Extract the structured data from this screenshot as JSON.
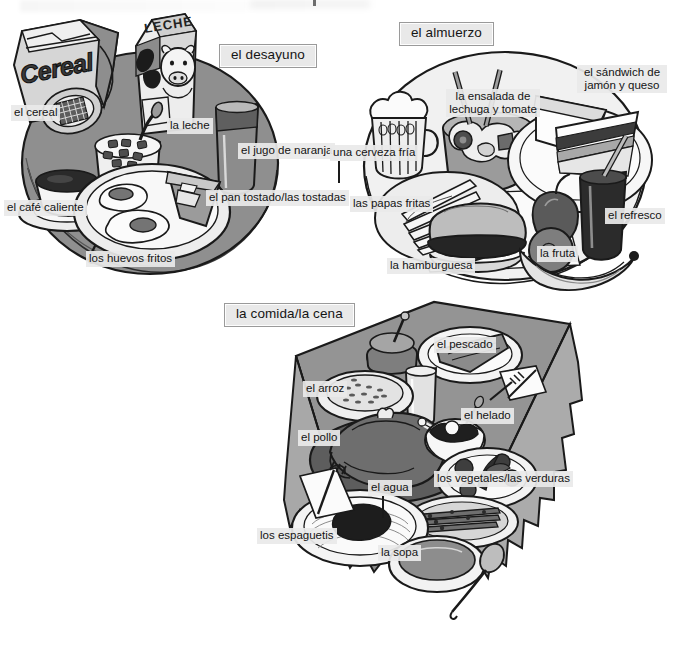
{
  "page": {
    "kind": "illustrated-vocabulary-plate",
    "language": "Spanish",
    "background_color": "#ffffff",
    "label_fill": "#e9e9e9",
    "ink_color": "#1a1a1a"
  },
  "sections": [
    {
      "id": "breakfast",
      "title": "el desayuno",
      "labels": [
        {
          "key": "cereal",
          "text": "el cereal"
        },
        {
          "key": "milk",
          "text": "la leche"
        },
        {
          "key": "oj",
          "text": "el jugo de naranja"
        },
        {
          "key": "coffee",
          "text": "el café caliente"
        },
        {
          "key": "toast",
          "text": "el pan tostado/las tostadas"
        },
        {
          "key": "eggs",
          "text": "los huevos fritos"
        }
      ],
      "props": [
        "cereal-box",
        "milk-carton",
        "orange-juice-glass",
        "coffee-cup-saucer",
        "cereal-bowl-spoon",
        "fried-eggs-plate",
        "toast-slices",
        "fork"
      ]
    },
    {
      "id": "lunch",
      "title": "el almuerzo",
      "labels": [
        {
          "key": "beer",
          "text": "una cerveza fría"
        },
        {
          "key": "salad",
          "text": "la ensalada de lechuga y tomate",
          "line1": "la ensalada de",
          "line2": "lechuga y tomate"
        },
        {
          "key": "sandwich",
          "text": "el sándwich de jamón y queso",
          "line1": "el sándwich de",
          "line2": "jamón y queso"
        },
        {
          "key": "fries",
          "text": "las papas fritas"
        },
        {
          "key": "burger",
          "text": "la hamburguesa"
        },
        {
          "key": "fruit",
          "text": "la fruta"
        },
        {
          "key": "soda",
          "text": "el refresco"
        }
      ],
      "props": [
        "beer-mug",
        "salad-bowl-tongs",
        "ham-cheese-sandwich-plate",
        "french-fries",
        "hamburger",
        "apple",
        "orange",
        "banana",
        "soda-glass-straw",
        "napkin"
      ]
    },
    {
      "id": "dinner",
      "title": "la comida/la cena",
      "labels": [
        {
          "key": "fish",
          "text": "el pescado"
        },
        {
          "key": "rice",
          "text": "el arroz"
        },
        {
          "key": "icecream",
          "text": "el helado"
        },
        {
          "key": "chicken",
          "text": "el pollo"
        },
        {
          "key": "vegetables",
          "text": "los vegetales/las verduras"
        },
        {
          "key": "water",
          "text": "el agua"
        },
        {
          "key": "spaghetti",
          "text": "los espaguetis"
        },
        {
          "key": "soup",
          "text": "la sopa"
        }
      ],
      "props": [
        "table-cloth",
        "fish-fillet-plate",
        "rice-bowl",
        "wine-carafe",
        "water-glass",
        "roast-chicken-platter",
        "ice-cream-bowl",
        "salad-greens-plate",
        "asparagus-plate",
        "spaghetti-plate",
        "soup-bowl",
        "spoon",
        "knife",
        "fork",
        "napkin"
      ]
    }
  ],
  "packaging_text": {
    "cereal_box": "Cereal",
    "milk_carton": "LECHE"
  }
}
